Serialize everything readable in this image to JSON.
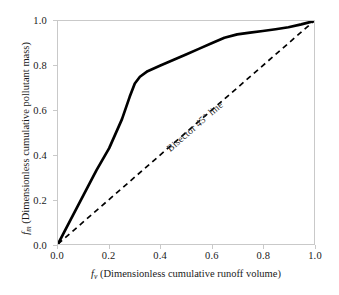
{
  "chart_data": {
    "type": "line",
    "title": "",
    "xlabel": "f_v (Dimensionless cumulative runoff volume)",
    "ylabel": "f_m (Dimensionless cumulative pollutant mass)",
    "xlim": [
      0.0,
      1.0
    ],
    "ylim": [
      0.0,
      1.0
    ],
    "grid": false,
    "legend_position": "none",
    "xticks": [
      "0.0",
      "0.2",
      "0.4",
      "0.6",
      "0.8",
      "1.0"
    ],
    "yticks": [
      "0.0",
      "0.2",
      "0.4",
      "0.6",
      "0.8",
      "1.0"
    ],
    "xtick_values": [
      0.0,
      0.2,
      0.4,
      0.6,
      0.8,
      1.0
    ],
    "ytick_values": [
      0.0,
      0.2,
      0.4,
      0.6,
      0.8,
      1.0
    ],
    "series": [
      {
        "name": "M(V) first-flush curve",
        "style": "solid",
        "color": "#000000",
        "linewidth": 2.6,
        "x": [
          0.0,
          0.05,
          0.1,
          0.15,
          0.2,
          0.25,
          0.28,
          0.3,
          0.32,
          0.35,
          0.4,
          0.45,
          0.5,
          0.55,
          0.6,
          0.65,
          0.7,
          0.75,
          0.8,
          0.85,
          0.9,
          0.95,
          1.0
        ],
        "y": [
          0.0,
          0.11,
          0.22,
          0.33,
          0.43,
          0.56,
          0.66,
          0.72,
          0.75,
          0.775,
          0.8,
          0.825,
          0.85,
          0.875,
          0.9,
          0.925,
          0.94,
          0.948,
          0.955,
          0.963,
          0.972,
          0.985,
          1.0
        ]
      },
      {
        "name": "Bisector 45 line",
        "style": "dashed",
        "color": "#000000",
        "linewidth": 1.6,
        "x": [
          0.0,
          1.0
        ],
        "y": [
          0.0,
          1.0
        ]
      }
    ],
    "annotations": [
      {
        "text": "Bisector 45° line",
        "x": 0.43,
        "y": 0.48,
        "rotation": -41
      }
    ],
    "colors": {
      "curve": "#000000",
      "bisector": "#000000",
      "axis": "#c9c9c9",
      "text": "#1a1a1a",
      "background": "#ffffff"
    }
  },
  "axes": {
    "x_label_var": "f",
    "x_label_sub": "v",
    "x_label_rest": " (Dimensionless cumulative runoff volume)",
    "y_label_var": "f",
    "y_label_sub": "m",
    "y_label_rest": " (Dimensionless cumulative pollutant mass)"
  },
  "annotation": {
    "bisector_label": "Bisector 45° line"
  }
}
